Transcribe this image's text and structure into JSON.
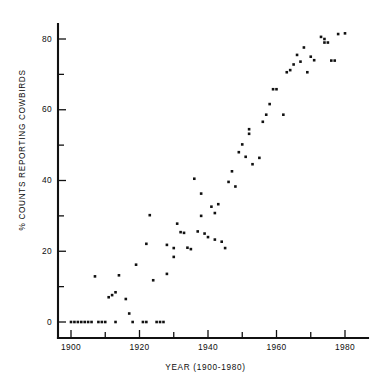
{
  "chart_data": {
    "type": "scatter",
    "title": "",
    "xlabel": "YEAR (1900-1980)",
    "ylabel": "% COUNTS REPORTING COWBIRDS",
    "xlim": [
      1895,
      1984
    ],
    "ylim": [
      -4,
      86
    ],
    "xticks": [
      1900,
      1920,
      1940,
      1960,
      1980
    ],
    "xtick_labels": [
      "1900",
      "1920",
      "1940",
      "1960",
      "1980"
    ],
    "xticks_minor": [
      1910,
      1930,
      1950,
      1970
    ],
    "yticks": [
      0,
      20,
      40,
      60,
      80
    ],
    "ytick_labels": [
      "0",
      "20",
      "40",
      "60",
      "80"
    ],
    "yticks_minor": [
      10,
      30,
      50,
      70
    ],
    "grid": false,
    "legend": false,
    "marker": "square",
    "marker_color": "#111111",
    "points": [
      {
        "x": 1900,
        "y": 0
      },
      {
        "x": 1901,
        "y": 0
      },
      {
        "x": 1902,
        "y": 0
      },
      {
        "x": 1903,
        "y": 0
      },
      {
        "x": 1904,
        "y": 0
      },
      {
        "x": 1905,
        "y": 0
      },
      {
        "x": 1906,
        "y": 0
      },
      {
        "x": 1907,
        "y": 12.9
      },
      {
        "x": 1908,
        "y": 0
      },
      {
        "x": 1909,
        "y": 0
      },
      {
        "x": 1910,
        "y": 0
      },
      {
        "x": 1911,
        "y": 7.0
      },
      {
        "x": 1912,
        "y": 7.6
      },
      {
        "x": 1913,
        "y": 0
      },
      {
        "x": 1913,
        "y": 8.4
      },
      {
        "x": 1914,
        "y": 13.2
      },
      {
        "x": 1916,
        "y": 6.5
      },
      {
        "x": 1917,
        "y": 2.4
      },
      {
        "x": 1918,
        "y": 0
      },
      {
        "x": 1919,
        "y": 16.2
      },
      {
        "x": 1921,
        "y": 0
      },
      {
        "x": 1922,
        "y": 0
      },
      {
        "x": 1922,
        "y": 22.1
      },
      {
        "x": 1923,
        "y": 30.2
      },
      {
        "x": 1924,
        "y": 11.8
      },
      {
        "x": 1925,
        "y": 0
      },
      {
        "x": 1926,
        "y": 0
      },
      {
        "x": 1927,
        "y": 0
      },
      {
        "x": 1928,
        "y": 13.6
      },
      {
        "x": 1928,
        "y": 21.8
      },
      {
        "x": 1930,
        "y": 20.9
      },
      {
        "x": 1930,
        "y": 18.4
      },
      {
        "x": 1931,
        "y": 27.8
      },
      {
        "x": 1932,
        "y": 25.4
      },
      {
        "x": 1933,
        "y": 25.2
      },
      {
        "x": 1934,
        "y": 21.0
      },
      {
        "x": 1935,
        "y": 20.6
      },
      {
        "x": 1936,
        "y": 40.5
      },
      {
        "x": 1937,
        "y": 25.6
      },
      {
        "x": 1938,
        "y": 30.0
      },
      {
        "x": 1938,
        "y": 36.3
      },
      {
        "x": 1939,
        "y": 25.0
      },
      {
        "x": 1940,
        "y": 24.0
      },
      {
        "x": 1941,
        "y": 32.6
      },
      {
        "x": 1942,
        "y": 30.8
      },
      {
        "x": 1942,
        "y": 23.3
      },
      {
        "x": 1943,
        "y": 33.3
      },
      {
        "x": 1944,
        "y": 22.7
      },
      {
        "x": 1945,
        "y": 20.9
      },
      {
        "x": 1946,
        "y": 39.6
      },
      {
        "x": 1947,
        "y": 42.6
      },
      {
        "x": 1948,
        "y": 38.3
      },
      {
        "x": 1949,
        "y": 48.0
      },
      {
        "x": 1950,
        "y": 50.2
      },
      {
        "x": 1951,
        "y": 46.7
      },
      {
        "x": 1952,
        "y": 54.5
      },
      {
        "x": 1952,
        "y": 53.2
      },
      {
        "x": 1953,
        "y": 44.6
      },
      {
        "x": 1955,
        "y": 46.4
      },
      {
        "x": 1956,
        "y": 56.6
      },
      {
        "x": 1957,
        "y": 58.6
      },
      {
        "x": 1958,
        "y": 61.6
      },
      {
        "x": 1959,
        "y": 65.8
      },
      {
        "x": 1960,
        "y": 65.8
      },
      {
        "x": 1962,
        "y": 58.6
      },
      {
        "x": 1963,
        "y": 70.6
      },
      {
        "x": 1964,
        "y": 71.2
      },
      {
        "x": 1965,
        "y": 72.8
      },
      {
        "x": 1966,
        "y": 75.5
      },
      {
        "x": 1967,
        "y": 73.6
      },
      {
        "x": 1968,
        "y": 77.6
      },
      {
        "x": 1969,
        "y": 70.6
      },
      {
        "x": 1970,
        "y": 75.0
      },
      {
        "x": 1971,
        "y": 74.0
      },
      {
        "x": 1973,
        "y": 80.6
      },
      {
        "x": 1974,
        "y": 80.0
      },
      {
        "x": 1974,
        "y": 79.0
      },
      {
        "x": 1975,
        "y": 79.0
      },
      {
        "x": 1976,
        "y": 73.9
      },
      {
        "x": 1977,
        "y": 73.9
      },
      {
        "x": 1978,
        "y": 81.4
      },
      {
        "x": 1980,
        "y": 81.6
      }
    ]
  },
  "axes": {
    "x_title": "YEAR (1900-1980)",
    "y_title": "% COUNTS REPORTING COWBIRDS"
  }
}
